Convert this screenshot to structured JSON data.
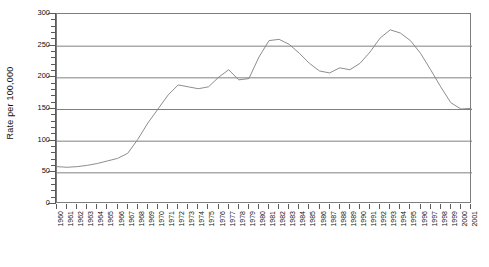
{
  "chart_data": {
    "type": "line",
    "title": "",
    "xlabel": "",
    "ylabel": "Rate per 100,000",
    "ylim": [
      0,
      300
    ],
    "ytick_step": 50,
    "yminor_step": 10,
    "grid": true,
    "legend": false,
    "line_color": "#808080",
    "grid_color": "#808080",
    "axis_color": "#5a5a5a",
    "ytick_labels": [
      "300",
      "250",
      "200",
      "150",
      "100",
      "50",
      "0"
    ],
    "ytick_values": [
      300,
      250,
      200,
      150,
      100,
      50,
      0
    ],
    "categories": [
      "1960",
      "1961",
      "1962",
      "1963",
      "1964",
      "1965",
      "1966",
      "1967",
      "1968",
      "1969",
      "1970",
      "1971",
      "1972",
      "1973",
      "1974",
      "1975",
      "1976",
      "1977",
      "1978",
      "1979",
      "1980",
      "1981",
      "1982",
      "1983",
      "1984",
      "1985",
      "1986",
      "1987",
      "1988",
      "1989",
      "1990",
      "1991",
      "1992",
      "1993",
      "1994",
      "1995",
      "1996",
      "1997",
      "1998",
      "1999",
      "2000",
      "2001"
    ],
    "values": [
      59,
      58,
      59,
      61,
      64,
      68,
      72,
      80,
      102,
      128,
      150,
      172,
      188,
      185,
      182,
      185,
      200,
      212,
      196,
      198,
      232,
      258,
      260,
      252,
      238,
      222,
      210,
      207,
      215,
      212,
      222,
      240,
      262,
      275,
      270,
      258,
      238,
      212,
      185,
      160,
      150,
      151
    ],
    "xlim_labels": [
      "1960",
      "2001"
    ]
  }
}
